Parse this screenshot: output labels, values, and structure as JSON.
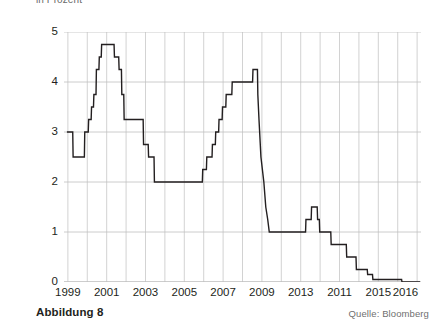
{
  "subtitle": "in Prozent",
  "caption": "Abbildung 8",
  "source": "Quelle: Bloomberg",
  "colors": {
    "line": "#231f20",
    "grid": "#bfbfbf",
    "axis": "#9a9a9a",
    "text": "#231f20",
    "muted": "#6f6f6f",
    "background": "#ffffff"
  },
  "chart_data": {
    "type": "line",
    "title": "",
    "subtitle": "in Prozent",
    "xlabel": "",
    "ylabel": "in Prozent",
    "grid": true,
    "legend": false,
    "line_style": "step",
    "xlim": [
      1998.8,
      2017.2
    ],
    "ylim": [
      0,
      5
    ],
    "yticks": [
      0,
      1,
      2,
      3,
      4,
      5
    ],
    "ytick_labels": [
      "0",
      "1",
      "2",
      "3",
      "4",
      "5"
    ],
    "xtick_labels": [
      "1999",
      "2001",
      "2003",
      "2005",
      "2007",
      "2009",
      "2013",
      "2011",
      "2015",
      "2016"
    ],
    "xtick_positions": [
      1999,
      2001,
      2003,
      2005,
      2007,
      2009,
      2011,
      2013,
      2015,
      2016.4
    ],
    "series": [
      {
        "name": "Leitzins",
        "values": [
          {
            "x": 1998.95,
            "y": 3.0
          },
          {
            "x": 1999.25,
            "y": 3.0
          },
          {
            "x": 1999.27,
            "y": 2.5
          },
          {
            "x": 1999.85,
            "y": 2.5
          },
          {
            "x": 1999.87,
            "y": 3.0
          },
          {
            "x": 2000.05,
            "y": 3.0
          },
          {
            "x": 2000.07,
            "y": 3.25
          },
          {
            "x": 2000.2,
            "y": 3.25
          },
          {
            "x": 2000.22,
            "y": 3.5
          },
          {
            "x": 2000.32,
            "y": 3.5
          },
          {
            "x": 2000.34,
            "y": 3.75
          },
          {
            "x": 2000.45,
            "y": 3.75
          },
          {
            "x": 2000.47,
            "y": 4.25
          },
          {
            "x": 2000.6,
            "y": 4.25
          },
          {
            "x": 2000.62,
            "y": 4.5
          },
          {
            "x": 2000.72,
            "y": 4.5
          },
          {
            "x": 2000.74,
            "y": 4.75
          },
          {
            "x": 2001.38,
            "y": 4.75
          },
          {
            "x": 2001.4,
            "y": 4.5
          },
          {
            "x": 2001.62,
            "y": 4.5
          },
          {
            "x": 2001.64,
            "y": 4.25
          },
          {
            "x": 2001.76,
            "y": 4.25
          },
          {
            "x": 2001.78,
            "y": 3.75
          },
          {
            "x": 2001.88,
            "y": 3.75
          },
          {
            "x": 2001.9,
            "y": 3.25
          },
          {
            "x": 2002.88,
            "y": 3.25
          },
          {
            "x": 2002.9,
            "y": 2.75
          },
          {
            "x": 2003.14,
            "y": 2.75
          },
          {
            "x": 2003.16,
            "y": 2.5
          },
          {
            "x": 2003.44,
            "y": 2.5
          },
          {
            "x": 2003.46,
            "y": 2.0
          },
          {
            "x": 2005.93,
            "y": 2.0
          },
          {
            "x": 2005.95,
            "y": 2.25
          },
          {
            "x": 2006.14,
            "y": 2.25
          },
          {
            "x": 2006.16,
            "y": 2.5
          },
          {
            "x": 2006.43,
            "y": 2.5
          },
          {
            "x": 2006.45,
            "y": 2.75
          },
          {
            "x": 2006.6,
            "y": 2.75
          },
          {
            "x": 2006.62,
            "y": 3.0
          },
          {
            "x": 2006.77,
            "y": 3.0
          },
          {
            "x": 2006.79,
            "y": 3.25
          },
          {
            "x": 2006.95,
            "y": 3.25
          },
          {
            "x": 2006.97,
            "y": 3.5
          },
          {
            "x": 2007.14,
            "y": 3.5
          },
          {
            "x": 2007.16,
            "y": 3.75
          },
          {
            "x": 2007.45,
            "y": 3.75
          },
          {
            "x": 2007.47,
            "y": 4.0
          },
          {
            "x": 2008.52,
            "y": 4.0
          },
          {
            "x": 2008.54,
            "y": 4.25
          },
          {
            "x": 2008.77,
            "y": 4.25
          },
          {
            "x": 2008.79,
            "y": 3.75
          },
          {
            "x": 2008.85,
            "y": 3.25
          },
          {
            "x": 2008.95,
            "y": 2.5
          },
          {
            "x": 2009.1,
            "y": 2.0
          },
          {
            "x": 2009.2,
            "y": 1.5
          },
          {
            "x": 2009.3,
            "y": 1.25
          },
          {
            "x": 2009.38,
            "y": 1.0
          },
          {
            "x": 2011.25,
            "y": 1.0
          },
          {
            "x": 2011.27,
            "y": 1.25
          },
          {
            "x": 2011.54,
            "y": 1.25
          },
          {
            "x": 2011.56,
            "y": 1.5
          },
          {
            "x": 2011.85,
            "y": 1.5
          },
          {
            "x": 2011.87,
            "y": 1.25
          },
          {
            "x": 2011.96,
            "y": 1.25
          },
          {
            "x": 2011.98,
            "y": 1.0
          },
          {
            "x": 2012.55,
            "y": 1.0
          },
          {
            "x": 2012.57,
            "y": 0.75
          },
          {
            "x": 2013.35,
            "y": 0.75
          },
          {
            "x": 2013.37,
            "y": 0.5
          },
          {
            "x": 2013.85,
            "y": 0.5
          },
          {
            "x": 2013.87,
            "y": 0.25
          },
          {
            "x": 2014.43,
            "y": 0.25
          },
          {
            "x": 2014.45,
            "y": 0.15
          },
          {
            "x": 2014.7,
            "y": 0.15
          },
          {
            "x": 2014.72,
            "y": 0.05
          },
          {
            "x": 2016.2,
            "y": 0.05
          },
          {
            "x": 2016.22,
            "y": 0.0
          },
          {
            "x": 2017.15,
            "y": 0.0
          }
        ]
      }
    ]
  }
}
